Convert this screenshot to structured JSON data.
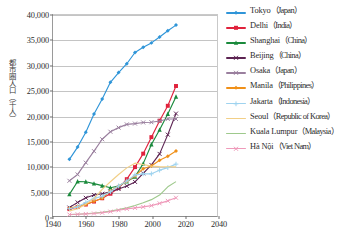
{
  "chart_data": {
    "type": "line",
    "title": "",
    "xlabel": "",
    "ylabel": "都市圏人口（千人）",
    "xlim": [
      1940,
      2040
    ],
    "ylim": [
      0,
      40000
    ],
    "xticks": [
      1940,
      1960,
      1980,
      2000,
      2020,
      2040
    ],
    "yticks": [
      0,
      5000,
      10000,
      15000,
      20000,
      25000,
      30000,
      35000,
      40000
    ],
    "ytick_labels": [
      "0",
      "5,000",
      "10,000",
      "15,000",
      "20,000",
      "25,000",
      "30,000",
      "35,000",
      "40,000"
    ],
    "grid": true,
    "legend_position": "right",
    "x": [
      1950,
      1955,
      1960,
      1965,
      1970,
      1975,
      1980,
      1985,
      1990,
      1995,
      2000,
      2005,
      2010,
      2015
    ],
    "series": [
      {
        "name": "Tokyo",
        "country": "Japan",
        "label": "Tokyo",
        "paren": "（Japan）",
        "color": "#2f95d8",
        "marker": "diamond",
        "values": [
          11275,
          13713,
          16679,
          20284,
          23298,
          26615,
          28549,
          30304,
          32530,
          33587,
          34450,
          35622,
          36860,
          37990
        ]
      },
      {
        "name": "Delhi",
        "country": "India",
        "label": "Delhi",
        "paren": "（India）",
        "color": "#e0223c",
        "marker": "square",
        "values": [
          1369,
          1782,
          2283,
          2874,
          3531,
          4426,
          5558,
          7326,
          9726,
          12407,
          15692,
          18970,
          21935,
          25871
        ]
      },
      {
        "name": "Shanghai",
        "country": "China",
        "label": "Shanghai",
        "paren": "（China）",
        "color": "#1a8a3c",
        "marker": "triangle",
        "values": [
          4301,
          6866,
          6820,
          6450,
          6036,
          5627,
          5966,
          6847,
          7823,
          10424,
          14247,
          17160,
          20314,
          23741
        ]
      },
      {
        "name": "Beijing",
        "country": "China",
        "label": "Beijing",
        "paren": "（China）",
        "color": "#5c2352",
        "marker": "x",
        "values": [
          1671,
          2709,
          3621,
          4168,
          4426,
          4828,
          5366,
          5962,
          6788,
          8486,
          10162,
          12358,
          16190,
          20384
        ]
      },
      {
        "name": "Osaka",
        "country": "Japan",
        "label": "Osaka",
        "paren": "（Japan）",
        "color": "#9a7f9e",
        "marker": "x",
        "values": [
          7005,
          8269,
          10615,
          12900,
          15272,
          16770,
          17588,
          18229,
          18389,
          18614,
          18660,
          18900,
          19313,
          19303
        ]
      },
      {
        "name": "Manila",
        "country": "Philippines",
        "label": "Manila",
        "paren": "（Philippines）",
        "color": "#f09018",
        "marker": "diamond",
        "values": [
          1544,
          1938,
          2274,
          2928,
          3534,
          4999,
          5955,
          6888,
          7973,
          9401,
          9958,
          11100,
          11887,
          12946
        ]
      },
      {
        "name": "Jakarta",
        "country": "Indonesia",
        "label": "Jakarta",
        "paren": "（Indonesia）",
        "color": "#9fd3ef",
        "marker": "plus",
        "values": [
          1452,
          1823,
          2678,
          3511,
          3915,
          4814,
          5984,
          6969,
          8175,
          8390,
          8390,
          9125,
          9630,
          10323
        ]
      },
      {
        "name": "Seoul",
        "country": "Republic of Korea",
        "label": "Seoul",
        "paren": "（Republic of Korea）",
        "color": "#f2cf86",
        "marker": "none",
        "values": [
          1021,
          1446,
          2361,
          3453,
          5312,
          6808,
          8258,
          9579,
          10518,
          10256,
          9917,
          9825,
          9796,
          9774
        ]
      },
      {
        "name": "Kuala Lumpur",
        "country": "Malaysia",
        "label": "Kuala Lumpur",
        "paren": "（Malaysia）",
        "color": "#9ec98c",
        "marker": "none",
        "values": [
          261,
          340,
          437,
          564,
          746,
          982,
          1268,
          1611,
          2088,
          2648,
          3257,
          4170,
          5810,
          6837
        ]
      },
      {
        "name": "Hà Nội",
        "country": "Viet Nam",
        "label": "Hà Nội",
        "paren": "（Viet Nam）",
        "color": "#ef9aba",
        "marker": "x",
        "values": [
          288,
          339,
          411,
          503,
          646,
          874,
          1146,
          1418,
          1607,
          1805,
          2070,
          2520,
          3017,
          3629
        ]
      }
    ]
  },
  "caption": ""
}
